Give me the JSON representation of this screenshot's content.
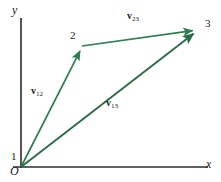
{
  "figure": {
    "type": "vector-diagram",
    "title": "",
    "background_color": "#ffffff",
    "axis_color": "#2b2b2b",
    "vector_color": "#2e7d4f",
    "vector_color_dark": "#2a6b45",
    "label_color": "#1a1a1a"
  },
  "axes": {
    "x_label": "x",
    "y_label": "y",
    "origin_label": "O"
  },
  "points": [
    {
      "id": "p1",
      "label": "1",
      "x": 21,
      "y": 167
    },
    {
      "id": "p2",
      "label": "2",
      "x": 82,
      "y": 47
    },
    {
      "id": "p3",
      "label": "3",
      "x": 197,
      "y": 30
    }
  ],
  "vectors": [
    {
      "id": "v12",
      "symbol": "v",
      "subscript": "12",
      "from": "p1",
      "to": "p2",
      "x1": 21,
      "y1": 167,
      "x2": 82,
      "y2": 47,
      "label_x": 31,
      "label_y": 88
    },
    {
      "id": "v23",
      "symbol": "v",
      "subscript": "23",
      "from": "p2",
      "to": "p3",
      "x1": 82,
      "y1": 46,
      "x2": 197,
      "y2": 30,
      "label_x": 127,
      "label_y": 13
    },
    {
      "id": "v13",
      "symbol": "v",
      "subscript": "13",
      "from": "p1",
      "to": "p3",
      "x1": 21,
      "y1": 167,
      "x2": 197,
      "y2": 31,
      "label_x": 106,
      "label_y": 100
    }
  ],
  "axis_lines": {
    "y_axis": {
      "x1": 21,
      "y1": 18,
      "x2": 21,
      "y2": 168
    },
    "x_axis": {
      "x1": 13,
      "y1": 167,
      "x2": 208,
      "y2": 167
    }
  },
  "label_positions": {
    "y_label_x": 12,
    "y_label_y": 4,
    "x_label_x": 206,
    "x_label_y": 158,
    "origin_label_x": 10,
    "origin_label_y": 167,
    "p1_label_x": 11,
    "p1_label_y": 152,
    "p2_label_x": 70,
    "p2_label_y": 31,
    "p3_label_x": 205,
    "p3_label_y": 19
  }
}
